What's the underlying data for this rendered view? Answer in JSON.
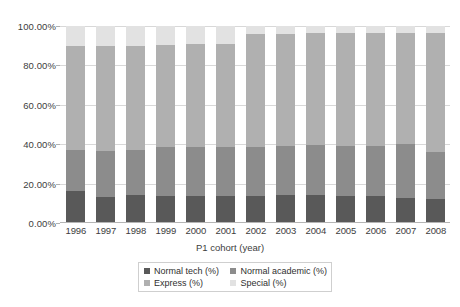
{
  "chart_data": {
    "type": "bar",
    "subtype": "100% stacked column",
    "title": "",
    "xlabel": "P1 cohort (year)",
    "ylabel": "",
    "ylim": [
      0,
      100
    ],
    "yticks": [
      "0.00%",
      "20.00%",
      "40.00%",
      "60.00%",
      "80.00%",
      "100.00%"
    ],
    "ytick_values": [
      0,
      20,
      40,
      60,
      80,
      100
    ],
    "grid": true,
    "legend_position": "bottom",
    "categories": [
      "1996",
      "1997",
      "1998",
      "1999",
      "2000",
      "2001",
      "2002",
      "2003",
      "2004",
      "2005",
      "2006",
      "2007",
      "2008"
    ],
    "series": [
      {
        "name": "Normal tech (%)",
        "color": "#595959",
        "values": [
          16.0,
          13.0,
          14.0,
          13.5,
          13.5,
          13.5,
          13.5,
          14.0,
          14.0,
          13.5,
          13.5,
          12.5,
          12.0
        ]
      },
      {
        "name": "Normal academic (%)",
        "color": "#8c8c8c",
        "values": [
          21.0,
          23.5,
          23.0,
          25.0,
          25.0,
          25.0,
          25.0,
          25.0,
          25.5,
          25.5,
          25.5,
          27.5,
          24.0
        ]
      },
      {
        "name": "Express (%)",
        "color": "#b0b0b0",
        "values": [
          53.0,
          53.5,
          53.0,
          52.0,
          52.5,
          52.5,
          57.5,
          57.0,
          57.0,
          57.5,
          57.5,
          56.5,
          60.5
        ]
      },
      {
        "name": "Special (%)",
        "color": "#e2e2e2",
        "values": [
          10.0,
          10.0,
          10.0,
          9.5,
          9.0,
          9.0,
          4.0,
          4.0,
          3.5,
          3.5,
          3.5,
          3.5,
          3.5
        ]
      }
    ]
  },
  "axis": {
    "xlabel": "P1 cohort (year)"
  },
  "legend": {
    "items": [
      {
        "label": "Normal tech (%)",
        "swatch": "sw-nt"
      },
      {
        "label": "Normal academic (%)",
        "swatch": "sw-na"
      },
      {
        "label": "Express (%)",
        "swatch": "sw-ex"
      },
      {
        "label": "Special (%)",
        "swatch": "sw-sp"
      }
    ]
  }
}
